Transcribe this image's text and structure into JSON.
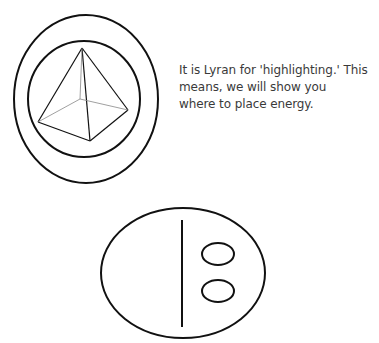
{
  "caption": {
    "lines": [
      "It is Lyran for 'highlighting.' This",
      "means, we will show you",
      "where to place energy."
    ]
  },
  "symbols": [
    {
      "name": "pyramid-in-concentric-circles",
      "description": "Pyramid inside two concentric ovals"
    },
    {
      "name": "oval-with-line-and-two-dots",
      "description": "Oval with vertical line and two small ovals"
    }
  ],
  "colors": {
    "stroke": "#111111",
    "text": "#3a3a3a",
    "background": "#ffffff"
  }
}
